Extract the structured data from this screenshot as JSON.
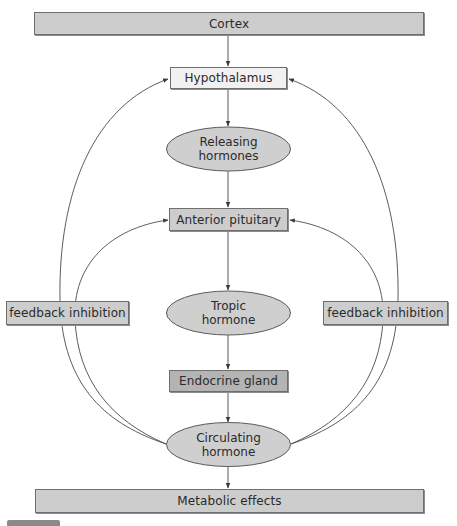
{
  "diagram": {
    "type": "flowchart",
    "colors": {
      "box_fill": "#cdcdcd",
      "box_fill_light": "#f1f1f1",
      "box_fill_dark": "#b4b4b4",
      "ellipse_fill": "#cfcfcf",
      "stroke": "#5a5a5a",
      "text": "#2a2a2a"
    },
    "nodes": {
      "cortex": {
        "label": "Cortex",
        "shape": "rectangle"
      },
      "hypothalamus": {
        "label": "Hypothalamus",
        "shape": "rectangle"
      },
      "releasing_hormones": {
        "line1": "Releasing",
        "line2": "hormones",
        "shape": "ellipse"
      },
      "anterior_pituitary": {
        "label": "Anterior pituitary",
        "shape": "rectangle"
      },
      "tropic_hormone": {
        "line1": "Tropic",
        "line2": "hormone",
        "shape": "ellipse"
      },
      "endocrine_gland": {
        "label": "Endocrine gland",
        "shape": "rectangle"
      },
      "circulating_hormone": {
        "line1": "Circulating",
        "line2": "hormone",
        "shape": "ellipse"
      },
      "metabolic_effects": {
        "label": "Metabolic effects",
        "shape": "rectangle"
      },
      "feedback_left": {
        "label": "feedback inhibition",
        "shape": "rectangle"
      },
      "feedback_right": {
        "label": "feedback inhibition",
        "shape": "rectangle"
      }
    },
    "edges": [
      {
        "from": "Cortex",
        "to": "Hypothalamus"
      },
      {
        "from": "Hypothalamus",
        "to": "Releasing hormones"
      },
      {
        "from": "Releasing hormones",
        "to": "Anterior pituitary"
      },
      {
        "from": "Anterior pituitary",
        "to": "Tropic hormone"
      },
      {
        "from": "Tropic hormone",
        "to": "Endocrine gland"
      },
      {
        "from": "Endocrine gland",
        "to": "Circulating hormone"
      },
      {
        "from": "Circulating hormone",
        "to": "Metabolic effects"
      },
      {
        "from": "Circulating hormone",
        "to": "Hypothalamus",
        "label": "feedback inhibition",
        "side": "left"
      },
      {
        "from": "Circulating hormone",
        "to": "Anterior pituitary",
        "label": "feedback inhibition",
        "side": "left"
      },
      {
        "from": "Circulating hormone",
        "to": "Hypothalamus",
        "label": "feedback inhibition",
        "side": "right"
      },
      {
        "from": "Circulating hormone",
        "to": "Anterior pituitary",
        "label": "feedback inhibition",
        "side": "right"
      }
    ]
  }
}
